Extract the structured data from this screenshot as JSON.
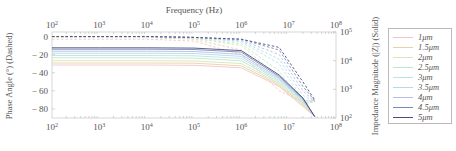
{
  "chart_data": {
    "type": "line",
    "title": "",
    "top_xlabel": "Frequency (Hz)",
    "xscale": "log",
    "xlim": [
      100,
      100000000
    ],
    "x_ticks": [
      "10^2",
      "10^3",
      "10^4",
      "10^5",
      "10^6",
      "10^7",
      "10^8"
    ],
    "left_ylabel": "Phase Angle (°) (Dashed)",
    "left_ylim": [
      -90,
      5
    ],
    "left_y_ticks": [
      0,
      -20,
      -40,
      -60,
      -80
    ],
    "right_ylabel": "Impedance Magnitude (|Z|) (Solid)",
    "right_yscale": "log",
    "right_ylim": [
      100,
      100000
    ],
    "right_y_ticks": [
      "10^2",
      "10^3",
      "10^4",
      "10^5"
    ],
    "legend_position": "right-outside",
    "grid": false,
    "series": [
      {
        "name": "1μm",
        "color": "#f2c6c6",
        "phase": [
          -3,
          -3,
          -3,
          -5,
          -20,
          -60,
          -72,
          -70
        ],
        "magnitude_log10": [
          3.85,
          3.85,
          3.85,
          3.84,
          3.75,
          3.1,
          2.4,
          2.05
        ]
      },
      {
        "name": "1.5μm",
        "color": "#e8d0a8",
        "phase": [
          -1,
          -1,
          -1,
          -3,
          -15,
          -55,
          -73,
          -71
        ],
        "magnitude_log10": [
          3.92,
          3.92,
          3.92,
          3.91,
          3.82,
          3.15,
          2.45,
          2.05
        ]
      },
      {
        "name": "2μm",
        "color": "#d6e6b8",
        "phase": [
          -1,
          -1,
          -1,
          -2,
          -10,
          -45,
          -75,
          -72
        ],
        "magnitude_log10": [
          4.0,
          4.0,
          4.0,
          3.99,
          3.9,
          3.2,
          2.5,
          2.05
        ]
      },
      {
        "name": "2.5μm",
        "color": "#bfe6c8",
        "phase": [
          0,
          0,
          0,
          -2,
          -8,
          -38,
          -74,
          -72
        ],
        "magnitude_log10": [
          4.1,
          4.1,
          4.1,
          4.09,
          4.0,
          3.25,
          2.55,
          2.05
        ]
      },
      {
        "name": "3μm",
        "color": "#b8e6e2",
        "phase": [
          0,
          0,
          0,
          -1,
          -6,
          -30,
          -70,
          -72
        ],
        "magnitude_log10": [
          4.18,
          4.18,
          4.18,
          4.17,
          4.08,
          3.3,
          2.6,
          2.05
        ]
      },
      {
        "name": "3.5μm",
        "color": "#b6d8ee",
        "phase": [
          0,
          0,
          0,
          -1,
          -5,
          -25,
          -65,
          -72
        ],
        "magnitude_log10": [
          4.26,
          4.26,
          4.26,
          4.25,
          4.15,
          3.35,
          2.62,
          2.05
        ]
      },
      {
        "name": "4μm",
        "color": "#b0bfe6",
        "phase": [
          0,
          0,
          0,
          -1,
          -4,
          -20,
          -60,
          -72
        ],
        "magnitude_log10": [
          4.33,
          4.33,
          4.33,
          4.32,
          4.22,
          3.4,
          2.65,
          2.05
        ]
      },
      {
        "name": "4.5μm",
        "color": "#7d86b8",
        "phase": [
          0,
          0,
          0,
          -1,
          -3,
          -15,
          -55,
          -71
        ],
        "magnitude_log10": [
          4.4,
          4.4,
          4.4,
          4.39,
          4.3,
          3.45,
          2.68,
          2.05
        ]
      },
      {
        "name": "5μm",
        "color": "#4a4f80",
        "phase": [
          0,
          0,
          0,
          -1,
          -3,
          -12,
          -50,
          -70
        ],
        "magnitude_log10": [
          4.45,
          4.45,
          4.45,
          4.44,
          4.35,
          3.5,
          2.7,
          2.05
        ]
      }
    ],
    "x_samples_log10": [
      2,
      3,
      4,
      5,
      6,
      6.8,
      7.3,
      7.55
    ]
  },
  "labels": {
    "top_xlabel": "Frequency (Hz)",
    "left_ylabel": "Phase Angle (°) (Dashed)",
    "right_ylabel": "Impedance Magnitude (|Z|) (Solid)"
  },
  "legend": [
    {
      "label": "1μm",
      "color": "#f2c6c6"
    },
    {
      "label": "1.5μm",
      "color": "#e8d0a8"
    },
    {
      "label": "2μm",
      "color": "#d6e6b8"
    },
    {
      "label": "2.5μm",
      "color": "#bfe6c8"
    },
    {
      "label": "3μm",
      "color": "#b8e6e2"
    },
    {
      "label": "3.5μm",
      "color": "#b6d8ee"
    },
    {
      "label": "4μm",
      "color": "#b0bfe6"
    },
    {
      "label": "4.5μm",
      "color": "#7d86b8"
    },
    {
      "label": "5μm",
      "color": "#4a4f80"
    }
  ]
}
